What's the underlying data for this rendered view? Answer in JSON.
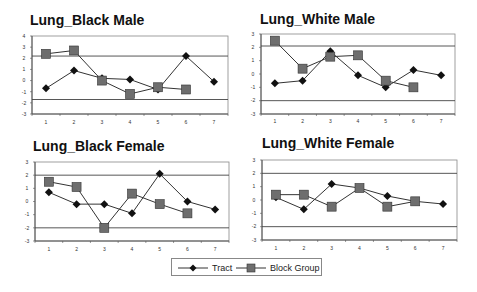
{
  "chart_data": [
    {
      "type": "line",
      "title": "Lung_Black Male",
      "xlabel": "",
      "ylabel": "",
      "x": [
        1,
        2,
        3,
        4,
        5,
        6,
        7
      ],
      "ylim": [
        -3,
        4
      ],
      "yticks": [
        4,
        3,
        2,
        1,
        0,
        -1,
        -2,
        -3
      ],
      "reference_lines": [
        2.2,
        -1.7
      ],
      "grid": false,
      "series": [
        {
          "name": "Tract",
          "marker": "diamond",
          "values": [
            -0.7,
            0.9,
            0.2,
            0.1,
            -0.8,
            2.2,
            -0.1
          ]
        },
        {
          "name": "Block Group",
          "marker": "square",
          "values": [
            2.4,
            2.7,
            0.0,
            -1.2,
            -0.6,
            -0.8
          ]
        }
      ]
    },
    {
      "type": "line",
      "title": "Lung_White Male",
      "xlabel": "",
      "ylabel": "",
      "x": [
        1,
        2,
        3,
        4,
        5,
        6,
        7
      ],
      "ylim": [
        -3,
        3
      ],
      "yticks": [
        3,
        2,
        1,
        0,
        -1,
        -2,
        -3
      ],
      "reference_lines": [
        2.1,
        -2.0
      ],
      "grid": false,
      "series": [
        {
          "name": "Tract",
          "marker": "diamond",
          "values": [
            -0.7,
            -0.5,
            1.7,
            -0.1,
            -1.0,
            0.3,
            -0.1
          ]
        },
        {
          "name": "Block Group",
          "marker": "square",
          "values": [
            2.5,
            0.4,
            1.3,
            1.4,
            -0.5,
            -1.0
          ]
        }
      ]
    },
    {
      "type": "line",
      "title": "Lung_Black Female",
      "xlabel": "",
      "ylabel": "",
      "x": [
        1,
        2,
        3,
        4,
        5,
        6,
        7
      ],
      "ylim": [
        -3,
        3
      ],
      "yticks": [
        3,
        2,
        1,
        0,
        -1,
        -2,
        -3
      ],
      "reference_lines": [
        2.0,
        -2.0
      ],
      "grid": false,
      "series": [
        {
          "name": "Tract",
          "marker": "diamond",
          "values": [
            0.7,
            -0.2,
            -0.2,
            -0.9,
            2.1,
            0.0,
            -0.6
          ]
        },
        {
          "name": "Block Group",
          "marker": "square",
          "values": [
            1.5,
            1.1,
            -2.0,
            0.6,
            -0.2,
            -0.9
          ]
        }
      ]
    },
    {
      "type": "line",
      "title": "Lung_White Female",
      "xlabel": "",
      "ylabel": "",
      "x": [
        1,
        2,
        3,
        4,
        5,
        6,
        7
      ],
      "ylim": [
        -3,
        3
      ],
      "yticks": [
        3,
        2,
        1,
        0,
        -1,
        -2,
        -3
      ],
      "reference_lines": [
        2.0,
        -2.0
      ],
      "grid": false,
      "series": [
        {
          "name": "Tract",
          "marker": "diamond",
          "values": [
            0.2,
            -0.7,
            1.2,
            0.9,
            0.3,
            -0.1,
            -0.3
          ]
        },
        {
          "name": "Block Group",
          "marker": "square",
          "values": [
            0.4,
            0.4,
            -0.5,
            0.9,
            -0.5,
            -0.1
          ]
        }
      ]
    }
  ],
  "legend": {
    "position": "bottom-center",
    "items": [
      {
        "label": "Tract",
        "marker": "diamond"
      },
      {
        "label": "Block Group",
        "marker": "square"
      }
    ]
  },
  "colors": {
    "tract_marker": "#111111",
    "block_marker": "#6e6e6e",
    "line": "#333333",
    "axis": "#555555"
  }
}
